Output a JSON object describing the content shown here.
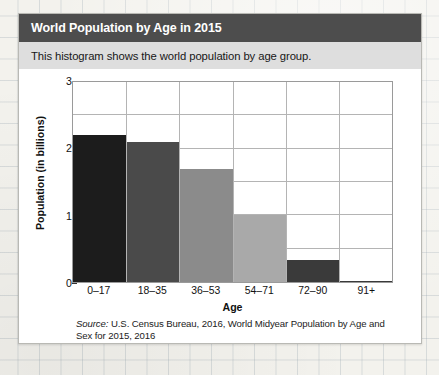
{
  "card": {
    "title": "World Population by Age in 2015",
    "subtitle": "This histogram shows the world population by age group.",
    "source_label": "Source:",
    "source_text": " U.S. Census Bureau, 2016, World Midyear Population by Age and Sex for 2015, 2016"
  },
  "colors": {
    "title_bar": "#4d4d4d",
    "subtitle_bar": "#dedede",
    "plot_border": "#9a9a9a",
    "gridline": "#b4b4b4",
    "paper": "#f3f2ed"
  },
  "chart_data": {
    "type": "bar",
    "title": "World Population by Age in 2015",
    "xlabel": "Age",
    "ylabel": "Population (in billions)",
    "categories": [
      "0–17",
      "18–35",
      "36–53",
      "54–71",
      "72–90",
      "91+"
    ],
    "values": [
      2.2,
      2.1,
      1.7,
      1.0,
      0.33,
      0.02
    ],
    "bar_colors": [
      "#1c1c1c",
      "#4a4a4a",
      "#8b8b8b",
      "#a9a9a9",
      "#3a3a3a",
      "#3a3a3a"
    ],
    "ylim": [
      0,
      3
    ],
    "ytick_labels": [
      "0",
      "1",
      "2",
      "3"
    ],
    "ytick_values": [
      0,
      1,
      2,
      3
    ],
    "gridline_values": [
      0.5,
      1.0,
      1.5,
      2.0,
      2.5
    ],
    "grid": true,
    "legend": "none"
  }
}
